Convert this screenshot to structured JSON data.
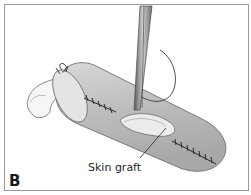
{
  "figure": {
    "panel_label": "B",
    "annotation": "Skin graft",
    "colors": {
      "frame": "#9a9a9a",
      "skin": "#c8c8c8",
      "skin_shadow": "#9e9e9e",
      "graft": "#e6e6e6",
      "suture": "#2a2a2a",
      "instrument": "#7a7a7a"
    }
  }
}
